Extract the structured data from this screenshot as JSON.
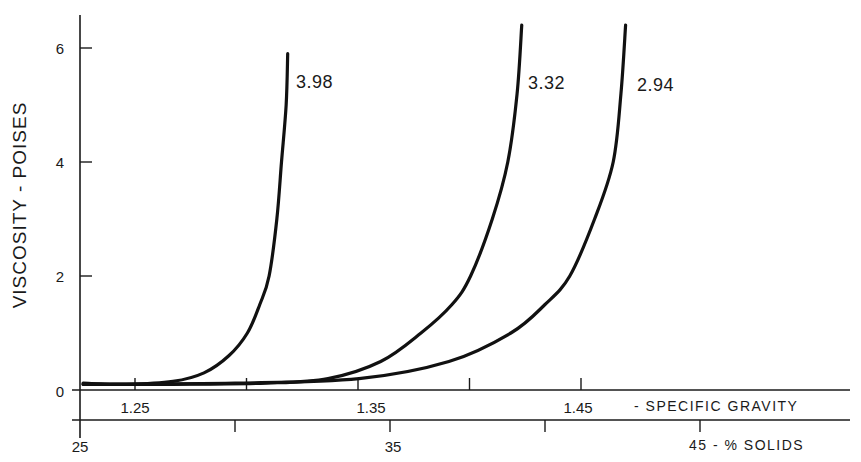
{
  "chart_data": {
    "type": "line",
    "title": "",
    "ylabel": "VISCOSITY - POISES",
    "xlabel_primary": "% SOLIDS",
    "xlabel_secondary": "SPECIFIC GRAVITY",
    "ylim": [
      0,
      6.5
    ],
    "xlim": [
      25,
      49
    ],
    "grid": false,
    "legend_position": "inline curve labels",
    "y_ticks": [
      0,
      2,
      4,
      6
    ],
    "x_ticks_solids": [
      25,
      30,
      35,
      40,
      45
    ],
    "x_tick_labels_solids": [
      "25",
      "",
      "35",
      "",
      "45"
    ],
    "x_ticks_specific_gravity": [
      1.25,
      1.3,
      1.35,
      1.4,
      1.45
    ],
    "x_tick_labels_specific_gravity": [
      "1.25",
      "",
      "1.35",
      "",
      "1.45"
    ],
    "series": [
      {
        "name": "3.98",
        "x": [
          25.1,
          26.5,
          28.0,
          29.0,
          29.8,
          30.4,
          30.8,
          31.1,
          31.35,
          31.5,
          31.65,
          31.7
        ],
        "y": [
          0.12,
          0.1,
          0.15,
          0.3,
          0.6,
          1.0,
          1.5,
          2.0,
          3.0,
          4.0,
          5.0,
          5.9
        ]
      },
      {
        "name": "3.32",
        "x": [
          25.1,
          28.0,
          31.0,
          33.0,
          34.7,
          36.0,
          37.0,
          37.6,
          38.3,
          38.8,
          39.1,
          39.25
        ],
        "y": [
          0.1,
          0.1,
          0.12,
          0.2,
          0.5,
          1.0,
          1.5,
          2.0,
          3.0,
          4.0,
          5.2,
          6.4
        ]
      },
      {
        "name": "2.94",
        "x": [
          25.1,
          30.0,
          34.0,
          36.9,
          38.9,
          40.0,
          40.8,
          41.6,
          42.2,
          42.45,
          42.6
        ],
        "y": [
          0.1,
          0.12,
          0.2,
          0.5,
          1.0,
          1.5,
          2.0,
          3.0,
          4.0,
          5.2,
          6.4
        ]
      }
    ]
  },
  "labels": {
    "ylabel": "VISCOSITY - POISES",
    "y_ticks": [
      "0",
      "2",
      "4",
      "6"
    ],
    "sg_ticks": [
      "1.25",
      "1.35",
      "1.45"
    ],
    "sg_title": "- SPECIFIC  GRAVITY",
    "solids_ticks": [
      "25",
      "35"
    ],
    "solids_title": "45 - % SOLIDS",
    "curve_labels": [
      "3.98",
      "3.32",
      "2.94"
    ]
  }
}
